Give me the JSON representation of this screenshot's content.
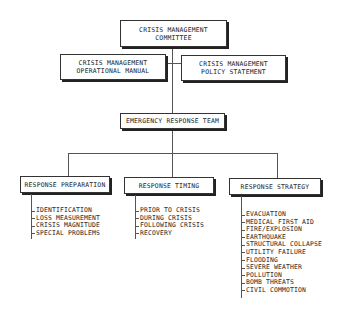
{
  "diagram": {
    "type": "organization-chart",
    "root": {
      "label_line1": "CRISIS MANAGEMENT",
      "label_line2": "COMMITTEE"
    },
    "side_boxes": [
      {
        "label_line1": "CRISIS MANAGEMENT",
        "label_line2": "OPERATIONAL MANUAL"
      },
      {
        "label_line1": "CRISIS MANAGEMENT",
        "label_line2": "POLICY STATEMENT"
      }
    ],
    "team": {
      "label": "EMERGENCY RESPONSE TEAM"
    },
    "branches": [
      {
        "label": "RESPONSE PREPARATION",
        "items": [
          "IDENTIFICATION",
          "LOSS MEASUREMENT",
          "CRISIS MAGNITUDE",
          "SPECIAL PROBLEMS"
        ]
      },
      {
        "label": "RESPONSE TIMING",
        "items": [
          "PRIOR TO CRISIS",
          "DURING CRISIS",
          "FOLLOWING CRISIS",
          "RECOVERY"
        ]
      },
      {
        "label": "RESPONSE STRATEGY",
        "items": [
          "EVACUATION",
          "MEDICAL FIRST AID",
          "FIRE/EXPLOSION",
          "EARTHQUAKE",
          "STRUCTURAL COLLAPSE",
          "UTILITY FAILURE",
          "FLOODING",
          "SEVERE WEATHER",
          "POLLUTION",
          "BOMB THREATS",
          "CIVIL COMMOTION"
        ]
      }
    ]
  }
}
